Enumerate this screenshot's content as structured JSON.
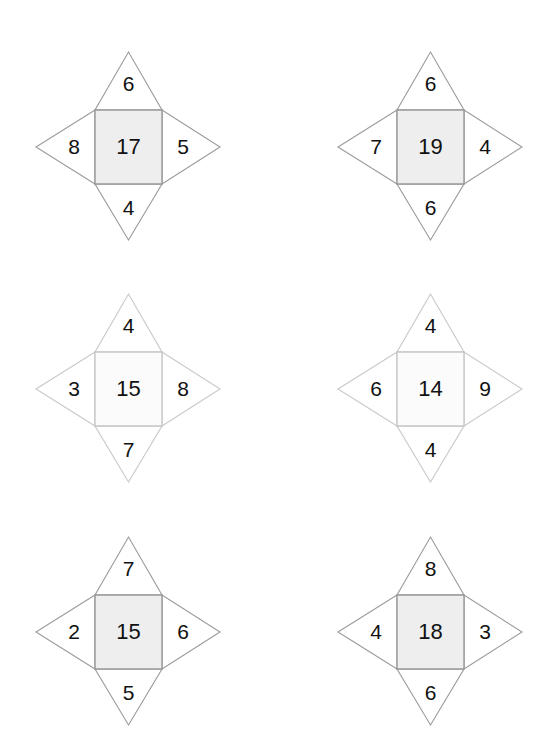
{
  "page": {
    "background_color": "#ffffff",
    "columns": 2,
    "rows": 3
  },
  "style": {
    "square_fill_dark": "#eeeeee",
    "square_fill_light": "#fbfbfb",
    "square_stroke_dark": "#999999",
    "square_stroke_light": "#c8c8c8",
    "point_fill": "#ffffff",
    "point_stroke_dark": "#9a9a9a",
    "point_stroke_light": "#c8c8c8",
    "text_color": "#111111"
  },
  "figures": [
    {
      "id": "figure-1",
      "position": {
        "row": 1,
        "column": 1,
        "left": 13,
        "top": 32
      },
      "shade": "dark",
      "center": "17",
      "top": "6",
      "left": "8",
      "right": "5",
      "bottom": "4"
    },
    {
      "id": "figure-2",
      "position": {
        "row": 1,
        "column": 2,
        "left": 315,
        "top": 32
      },
      "shade": "dark",
      "center": "19",
      "top": "6",
      "left": "7",
      "right": "4",
      "bottom": "6"
    },
    {
      "id": "figure-3",
      "position": {
        "row": 2,
        "column": 1,
        "left": 13,
        "top": 274
      },
      "shade": "light",
      "center": "15",
      "top": "4",
      "left": "3",
      "right": "8",
      "bottom": "7"
    },
    {
      "id": "figure-4",
      "position": {
        "row": 2,
        "column": 2,
        "left": 315,
        "top": 274
      },
      "shade": "light",
      "center": "14",
      "top": "4",
      "left": "6",
      "right": "9",
      "bottom": "4"
    },
    {
      "id": "figure-5",
      "position": {
        "row": 3,
        "column": 1,
        "left": 13,
        "top": 517
      },
      "shade": "dark",
      "center": "15",
      "top": "7",
      "left": "2",
      "right": "6",
      "bottom": "5"
    },
    {
      "id": "figure-6",
      "position": {
        "row": 3,
        "column": 2,
        "left": 315,
        "top": 517
      },
      "shade": "dark",
      "center": "18",
      "top": "8",
      "left": "4",
      "right": "3",
      "bottom": "6"
    }
  ]
}
